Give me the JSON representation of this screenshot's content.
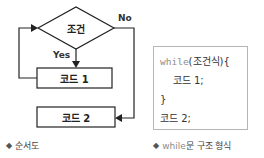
{
  "flowchart": {
    "condition_label": "조건",
    "yes_label": "Yes",
    "no_label": "No",
    "box1_label": "코드 1",
    "box2_label": "코드 2",
    "caption_bullet": "◆",
    "caption": "순서도"
  },
  "code_panel": {
    "line1_keyword": "while",
    "line1_rest": "(조건식){",
    "line2": "    코드 1;",
    "line3": "}",
    "line4": "코드 2;",
    "caption_bullet": "◆",
    "caption_keyword": "while",
    "caption_rest": "문 구조 형식"
  },
  "colors": {
    "line": "#222222",
    "code_border": "#b5b5b5",
    "keyword": "#8c8c8c"
  }
}
